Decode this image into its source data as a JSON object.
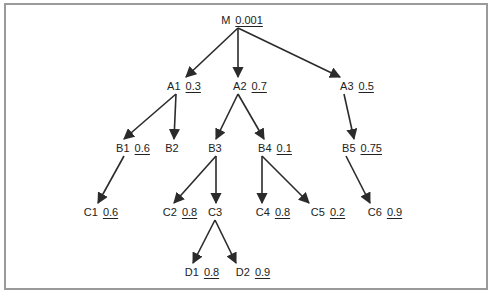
{
  "diagram": {
    "type": "tree",
    "nodes": [
      {
        "id": "M",
        "label": "M",
        "value": "0.001",
        "x": 242,
        "y": 20
      },
      {
        "id": "A1",
        "label": "A1",
        "value": "0.3",
        "x": 184,
        "y": 86
      },
      {
        "id": "A2",
        "label": "A2",
        "value": "0.7",
        "x": 250,
        "y": 86
      },
      {
        "id": "A3",
        "label": "A3",
        "value": "0.5",
        "x": 357,
        "y": 86
      },
      {
        "id": "B1",
        "label": "B1",
        "value": "0.6",
        "x": 133,
        "y": 148
      },
      {
        "id": "B2",
        "label": "B2",
        "value": "",
        "x": 172,
        "y": 148
      },
      {
        "id": "B3",
        "label": "B3",
        "value": "",
        "x": 215,
        "y": 148
      },
      {
        "id": "B4",
        "label": "B4",
        "value": "0.1",
        "x": 275,
        "y": 148
      },
      {
        "id": "B5",
        "label": "B5",
        "value": "0.75",
        "x": 362,
        "y": 148
      },
      {
        "id": "C1",
        "label": "C1",
        "value": "0.6",
        "x": 101,
        "y": 212
      },
      {
        "id": "C2",
        "label": "C2",
        "value": "0.8",
        "x": 180,
        "y": 212
      },
      {
        "id": "C3",
        "label": "C3",
        "value": "",
        "x": 215,
        "y": 212
      },
      {
        "id": "C4",
        "label": "C4",
        "value": "0.8",
        "x": 273,
        "y": 212
      },
      {
        "id": "C5",
        "label": "C5",
        "value": "0.2",
        "x": 328,
        "y": 212
      },
      {
        "id": "C6",
        "label": "C6",
        "value": "0.9",
        "x": 385,
        "y": 212
      },
      {
        "id": "D1",
        "label": "D1",
        "value": "0.8",
        "x": 202,
        "y": 272
      },
      {
        "id": "D2",
        "label": "D2",
        "value": "0.9",
        "x": 253,
        "y": 272
      }
    ],
    "edges": [
      {
        "from": "M",
        "to": "A1",
        "x1": 238,
        "y1": 28,
        "x2": 186,
        "y2": 77
      },
      {
        "from": "M",
        "to": "A2",
        "x1": 238,
        "y1": 28,
        "x2": 238,
        "y2": 77
      },
      {
        "from": "M",
        "to": "A3",
        "x1": 238,
        "y1": 28,
        "x2": 340,
        "y2": 77
      },
      {
        "from": "A1",
        "to": "B1",
        "x1": 176,
        "y1": 94,
        "x2": 124,
        "y2": 139
      },
      {
        "from": "A1",
        "to": "B2",
        "x1": 176,
        "y1": 94,
        "x2": 174,
        "y2": 139
      },
      {
        "from": "A2",
        "to": "B3",
        "x1": 238,
        "y1": 94,
        "x2": 216,
        "y2": 139
      },
      {
        "from": "A2",
        "to": "B4",
        "x1": 238,
        "y1": 94,
        "x2": 264,
        "y2": 139
      },
      {
        "from": "A3",
        "to": "B5",
        "x1": 344,
        "y1": 94,
        "x2": 354,
        "y2": 139
      },
      {
        "from": "B1",
        "to": "C1",
        "x1": 124,
        "y1": 156,
        "x2": 98,
        "y2": 203
      },
      {
        "from": "B3",
        "to": "C2",
        "x1": 216,
        "y1": 156,
        "x2": 174,
        "y2": 203
      },
      {
        "from": "B3",
        "to": "C3",
        "x1": 216,
        "y1": 156,
        "x2": 216,
        "y2": 203
      },
      {
        "from": "B4",
        "to": "C4",
        "x1": 262,
        "y1": 156,
        "x2": 262,
        "y2": 203
      },
      {
        "from": "B4",
        "to": "C5",
        "x1": 262,
        "y1": 156,
        "x2": 309,
        "y2": 203
      },
      {
        "from": "B5",
        "to": "C6",
        "x1": 346,
        "y1": 156,
        "x2": 370,
        "y2": 203
      },
      {
        "from": "C3",
        "to": "D1",
        "x1": 215,
        "y1": 220,
        "x2": 193,
        "y2": 263
      },
      {
        "from": "C3",
        "to": "D2",
        "x1": 215,
        "y1": 220,
        "x2": 236,
        "y2": 263
      }
    ],
    "colors": {
      "line": "#2b2b2b",
      "text": "#222222",
      "frame": "#9a9a9a",
      "background": "#ffffff"
    }
  }
}
